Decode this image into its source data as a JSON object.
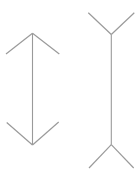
{
  "canvas": {
    "width": 140,
    "height": 175,
    "background_color": "#ffffff",
    "description": "Two vertical line figures, Muller-Lyer illusion stimulus"
  },
  "style": {
    "line_color": "#9a9a9a",
    "shaft_stroke_width": 1.1,
    "fin_stroke_width": 1.2
  },
  "figures": [
    {
      "id": "left-figure",
      "name": "double-headed-arrow-inward-fins",
      "shaft": {
        "x1": 32.5,
        "y1": 33.3,
        "x2": 32.5,
        "y2": 145.0
      },
      "fins": [
        {
          "name": "top-left-barb",
          "x1": 32.5,
          "y1": 33.3,
          "x2": 6.0,
          "y2": 54.0
        },
        {
          "name": "top-right-barb",
          "x1": 32.5,
          "y1": 33.3,
          "x2": 59.3,
          "y2": 54.0
        },
        {
          "name": "bottom-left-barb",
          "x1": 32.5,
          "y1": 145.0,
          "x2": 6.7,
          "y2": 122.5
        },
        {
          "name": "bottom-right-barb",
          "x1": 32.5,
          "y1": 145.0,
          "x2": 58.7,
          "y2": 122.0
        }
      ]
    },
    {
      "id": "right-figure",
      "name": "double-headed-arrow-outward-fins",
      "shaft": {
        "x1": 111.3,
        "y1": 34.5,
        "x2": 111.3,
        "y2": 144.7
      },
      "fins": [
        {
          "name": "top-left-fin",
          "x1": 111.3,
          "y1": 34.5,
          "x2": 88.3,
          "y2": 12.7
        },
        {
          "name": "top-right-fin",
          "x1": 111.3,
          "y1": 34.5,
          "x2": 134.3,
          "y2": 12.7
        },
        {
          "name": "bottom-left-fin",
          "x1": 111.3,
          "y1": 144.7,
          "x2": 89.0,
          "y2": 168.0
        },
        {
          "name": "bottom-right-fin",
          "x1": 111.3,
          "y1": 144.7,
          "x2": 133.7,
          "y2": 168.0
        }
      ]
    }
  ],
  "chart_data": {
    "type": "diagram",
    "title": "",
    "xlabel": "",
    "ylabel": "",
    "elements": [
      {
        "figure": "left",
        "shaft_length_px": 111.7,
        "fin_direction": "inward",
        "fin_length_px": 33.6
      },
      {
        "figure": "right",
        "shaft_length_px": 110.2,
        "fin_direction": "outward",
        "fin_length_px": 31.7
      }
    ]
  }
}
